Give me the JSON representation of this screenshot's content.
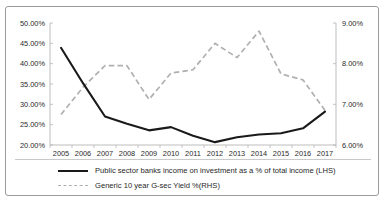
{
  "chart_data": {
    "type": "line",
    "title": "",
    "xlabel": "",
    "ylabel": "",
    "grid": false,
    "legend_position": "bottom",
    "categories": [
      "2005",
      "2006",
      "2007",
      "2008",
      "2009",
      "2010",
      "2011",
      "2012",
      "2013",
      "2014",
      "2015",
      "2016",
      "2017"
    ],
    "axes": {
      "left": {
        "label": "LHS",
        "ylim": [
          20,
          50
        ],
        "tick_step": 5,
        "ticks": [
          50,
          45,
          40,
          35,
          30,
          25,
          20
        ],
        "tick_labels": [
          "50.00%",
          "45.00%",
          "40.00%",
          "35.00%",
          "30.00%",
          "25.00%",
          "20.00%"
        ]
      },
      "right": {
        "label": "RHS",
        "ylim": [
          6,
          9
        ],
        "tick_step": 1,
        "ticks": [
          9,
          8,
          7,
          6
        ],
        "tick_labels": [
          "9.00%",
          "8.00%",
          "7.00%",
          "6.00%"
        ]
      }
    },
    "series": [
      {
        "name": "Public sector banks income on investment as a % of total income (LHS)",
        "axis": "left",
        "style": "solid",
        "color": "#1a1a1a",
        "values": [
          43.9,
          35.2,
          27.0,
          25.2,
          23.6,
          24.4,
          22.3,
          20.7,
          21.9,
          22.6,
          22.9,
          24.1,
          28.2
        ]
      },
      {
        "name": "Generic 10 year G-sec Yield %(RHS)",
        "axis": "right",
        "style": "dashed",
        "color": "#b0b0b0",
        "values": [
          6.75,
          7.42,
          7.95,
          7.95,
          7.12,
          7.77,
          7.85,
          8.5,
          8.15,
          8.8,
          7.75,
          7.6,
          6.85
        ]
      }
    ]
  },
  "legend": {
    "items": [
      {
        "label": "Public sector banks income on investment as a % of total income (LHS)",
        "style": "solid"
      },
      {
        "label": "Generic 10 year G-sec Yield %(RHS)",
        "style": "dashed"
      }
    ]
  }
}
